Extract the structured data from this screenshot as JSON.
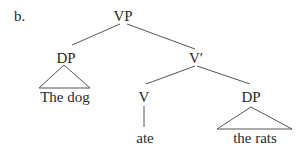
{
  "example_label": "b.",
  "tree": {
    "root": {
      "label": "VP"
    },
    "spec": {
      "label": "DP",
      "terminal": "The dog",
      "triangle": true
    },
    "bar": {
      "label": "V′"
    },
    "head": {
      "label": "V",
      "terminal": "ate"
    },
    "complement": {
      "label": "DP",
      "terminal": "the rats",
      "triangle": true
    }
  },
  "colors": {
    "line": "#555555",
    "text": "#2a2a2a",
    "background": "#ffffff"
  }
}
